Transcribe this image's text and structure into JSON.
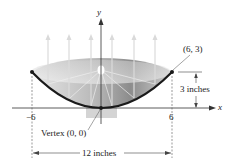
{
  "diagram": {
    "type": "parabolic reflector cross-section",
    "axes": {
      "x_label": "x",
      "y_label": "y"
    },
    "ticks": {
      "left": "−6",
      "right": "6"
    },
    "points": {
      "endpoint_label": "(6, 3)",
      "vertex_label": "Vertex (0, 0)"
    },
    "dimensions": {
      "height_label": "3 inches",
      "width_label": "12 inches"
    },
    "colors": {
      "curve": "#1a1a1a",
      "dish_light": "#e6e6e6",
      "dish_dark": "#8a8a8a",
      "rays": "#d8d8d8",
      "text": "#222222"
    },
    "parabola": {
      "equation": "y = x^2/12",
      "x_range": [
        -6,
        6
      ],
      "focus": [
        0,
        3
      ]
    }
  }
}
